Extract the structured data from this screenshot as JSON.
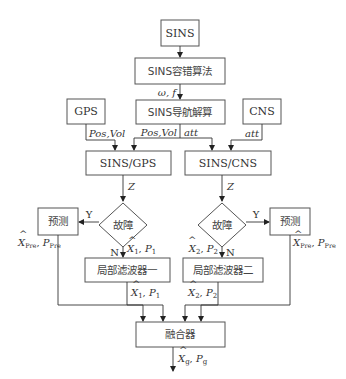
{
  "nodes": {
    "sins": "SINS",
    "fault_tolerant": "SINS容错算法",
    "nav_solution": "SINS导航解算",
    "gps": "GPS",
    "cns": "CNS",
    "sins_gps": "SINS/GPS",
    "sins_cns": "SINS/CNS",
    "fault_left": "故障",
    "fault_right": "故障",
    "predict_left": "预测",
    "predict_right": "预测",
    "local_filter_1": "局部滤波器一",
    "local_filter_2": "局部滤波器二",
    "fusion": "融合器"
  },
  "edge_labels": {
    "omega_f": "ω, f",
    "gps_pos_vol": "Pos,Vol",
    "nav_pos_vol": "Pos,Vol",
    "nav_att": "att",
    "cns_att": "att",
    "z_left": "Z",
    "z_right": "Z",
    "y_left": "Y",
    "y_right": "Y",
    "n_left": "N",
    "n_right": "N",
    "x1_in": {
      "x": "X",
      "sub": "1",
      "p": "P",
      "psub": "1"
    },
    "x1_out": {
      "x": "X",
      "sub": "1",
      "p": "P",
      "psub": "1"
    },
    "x2_in": {
      "x": "X",
      "sub": "2",
      "p": "P",
      "psub": "2"
    },
    "x2_out": {
      "x": "X",
      "sub": "2",
      "p": "P",
      "psub": "2"
    },
    "pre_left": {
      "x": "X",
      "sub": "Pre",
      "p": "P",
      "psub": "Pre"
    },
    "pre_right": {
      "x": "X",
      "sub": "Pre",
      "p": "P",
      "psub": "Pre"
    },
    "fused": {
      "x": "X",
      "sub": "g",
      "p": "P",
      "psub": "g"
    }
  }
}
